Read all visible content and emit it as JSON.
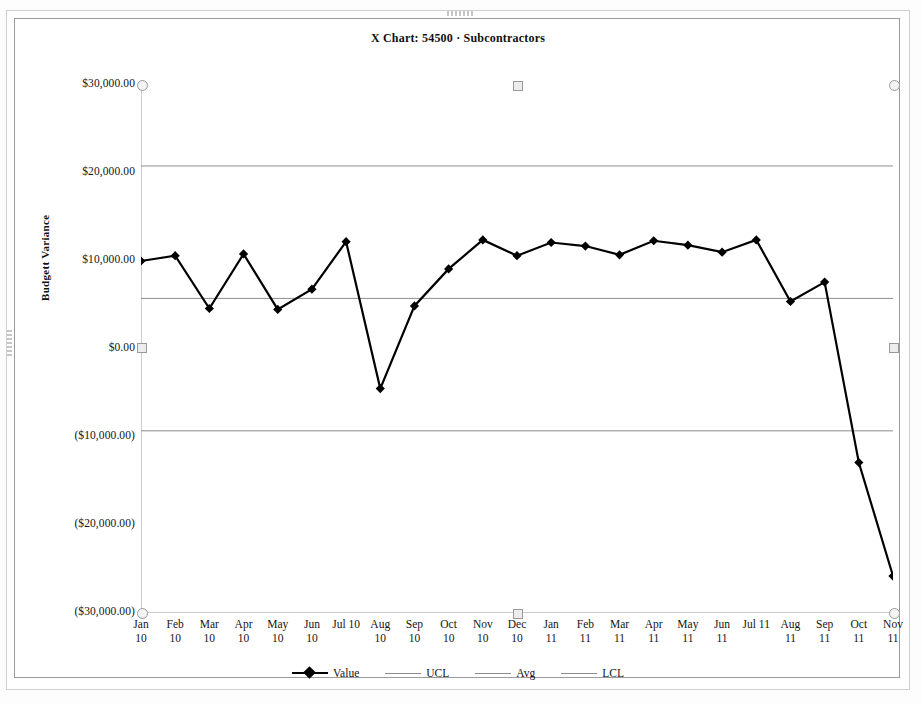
{
  "chart_data": {
    "type": "line",
    "title": "X Chart: 54500 · Subcontractors",
    "xlabel": "",
    "ylabel": "Budgett Variance",
    "ylim": [
      -30000,
      30000
    ],
    "grid": false,
    "legend_position": "bottom",
    "categories": [
      "Jan 10",
      "Feb 10",
      "Mar 10",
      "Apr 10",
      "May 10",
      "Jun 10",
      "Jul 10",
      "Aug 10",
      "Sep 10",
      "Oct 10",
      "Nov 10",
      "Dec 10",
      "Jan 11",
      "Feb 11",
      "Mar 11",
      "Apr 11",
      "May 11",
      "Jun 11",
      "Jul 11",
      "Aug 11",
      "Sep 11",
      "Oct 11",
      "Nov 11"
    ],
    "category_lines": [
      [
        "Jan",
        "10"
      ],
      [
        "Feb",
        "10"
      ],
      [
        "Mar",
        "10"
      ],
      [
        "Apr",
        "10"
      ],
      [
        "May",
        "10"
      ],
      [
        "Jun",
        "10"
      ],
      [
        "Jul 10",
        ""
      ],
      [
        "Aug",
        "10"
      ],
      [
        "Sep",
        "10"
      ],
      [
        "Oct",
        "10"
      ],
      [
        "Nov",
        "10"
      ],
      [
        "Dec",
        "10"
      ],
      [
        "Jan",
        "11"
      ],
      [
        "Feb",
        "11"
      ],
      [
        "Mar",
        "11"
      ],
      [
        "Apr",
        "11"
      ],
      [
        "May",
        "11"
      ],
      [
        "Jun",
        "11"
      ],
      [
        "Jul 11",
        ""
      ],
      [
        "Aug",
        "11"
      ],
      [
        "Sep",
        "11"
      ],
      [
        "Oct",
        "11"
      ],
      [
        "Nov",
        "11"
      ]
    ],
    "y_ticks": [
      30000,
      20000,
      10000,
      0,
      -10000,
      -20000,
      -30000
    ],
    "y_tick_labels": [
      "$30,000.00",
      "$20,000.00",
      "$10,000.00",
      "$0.00",
      "($10,000.00)",
      "($20,000.00)",
      "($30,000.00)"
    ],
    "series": [
      {
        "name": "Value",
        "color": "#000000",
        "marker": "diamond",
        "values": [
          10000,
          10600,
          4600,
          10800,
          4500,
          6800,
          12200,
          -4500,
          4900,
          9100,
          12400,
          10600,
          12100,
          11700,
          10700,
          12300,
          11800,
          11000,
          12400,
          5400,
          7600,
          -12900,
          -25800
        ]
      },
      {
        "name": "UCL",
        "color": "#8d8d8d",
        "marker": "none",
        "value": 20800
      },
      {
        "name": "Avg",
        "color": "#8d8d8d",
        "marker": "none",
        "value": 5750
      },
      {
        "name": "LCL",
        "color": "#8d8d8d",
        "marker": "none",
        "value": -9300
      }
    ],
    "legend": [
      {
        "label": "Value",
        "style": "thick-marker",
        "color": "#000000"
      },
      {
        "label": "UCL",
        "style": "thin",
        "color": "#8d8d8d"
      },
      {
        "label": "Avg",
        "style": "thin",
        "color": "#8d8d8d"
      },
      {
        "label": "LCL",
        "style": "thin",
        "color": "#8d8d8d"
      }
    ]
  },
  "colors": {
    "series": "#000000",
    "limit": "#8d8d8d",
    "axis": "#9b9b9b",
    "frame": "#9a9a9a",
    "background": "#ffffff"
  }
}
